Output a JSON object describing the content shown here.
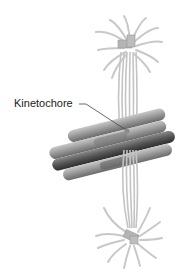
{
  "figure": {
    "labels": {
      "kinetochore": "Kinetochore"
    },
    "colors": {
      "microtubule": "#c8c8c8",
      "centrosome": "#b4b4b4",
      "chromatid_light": "#9a9a9a",
      "chromatid_dark": "#4a4a4a",
      "label_text": "#222222",
      "leader_line": "#444444"
    }
  }
}
